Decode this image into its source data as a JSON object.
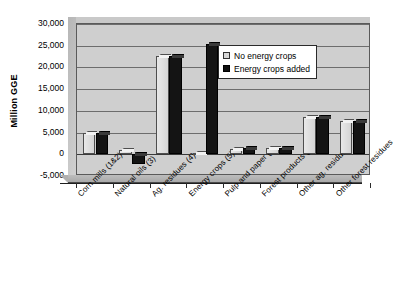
{
  "chart_data": {
    "type": "bar",
    "title": "",
    "xlabel": "",
    "ylabel": "Million GGE",
    "ylim": [
      -5000,
      30000
    ],
    "ytick_step": 5000,
    "grid": true,
    "legend_position": "inside-top-right",
    "yticks": [
      "30,000",
      "25,000",
      "20,000",
      "15,000",
      "10,000",
      "5,000",
      "0",
      "-5,000"
    ],
    "ytick_values": [
      30000,
      25000,
      20000,
      15000,
      10000,
      5000,
      0,
      -5000
    ],
    "categories": [
      "Corn mills (1&2)",
      "Natural oils (3)",
      "Ag. residues (4)",
      "Energy crops (5)",
      "Pulp and paper (6)",
      "Forest products (7)",
      "Other ag. residues",
      "Other forest residues"
    ],
    "series": [
      {
        "name": "No energy crops",
        "color": "#d8d8d8",
        "values": [
          4800,
          1100,
          22600,
          300,
          1300,
          1400,
          8700,
          7600
        ]
      },
      {
        "name": "Energy crops added",
        "color": "#101010",
        "values": [
          4800,
          -2300,
          22600,
          25500,
          1500,
          1500,
          8600,
          7700
        ]
      }
    ]
  },
  "legend": {
    "items": [
      {
        "label": "No energy crops",
        "swatch": "light"
      },
      {
        "label": "Energy crops added",
        "swatch": "dark"
      }
    ]
  },
  "axis": {
    "y_title": "Million GGE"
  }
}
